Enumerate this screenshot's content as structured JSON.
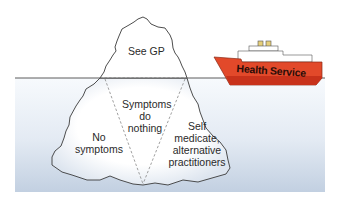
{
  "diagram": {
    "type": "iceberg-metaphor",
    "colors": {
      "background": "#ffffff",
      "water_top": "#f6f9fc",
      "water_bottom": "#c4d2e2",
      "iceberg_fill": "#ffffff",
      "iceberg_outline": "#3a3a3a",
      "hull": "#e2492a",
      "hull_stripe": "#c8321b",
      "superstructure": "#ffffff",
      "funnel": "#e6cf7a",
      "text": "#2a2a2a"
    },
    "above_water": {
      "label": "See GP"
    },
    "below_water": {
      "center": {
        "line1": "Symptoms",
        "line2": "do",
        "line3": "nothing"
      },
      "left": {
        "line1": "No",
        "line2": "symptoms"
      },
      "right": {
        "line1": "Self",
        "line2": "medicate,",
        "line3": "alternative",
        "line4": "practitioners"
      }
    },
    "ship": {
      "label": "Health Service"
    }
  }
}
